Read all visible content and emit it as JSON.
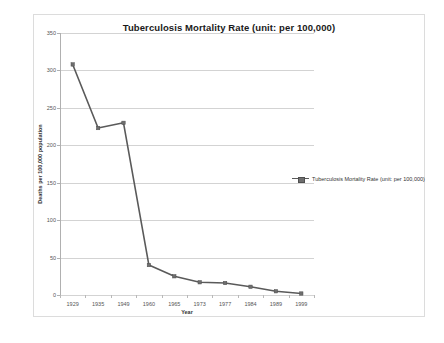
{
  "chart_data": {
    "type": "line",
    "title": "Tuberculosis Mortality Rate (unit: per 100,000)",
    "xlabel": "Year",
    "ylabel": "Deaths per 100,000 population",
    "categories": [
      "1929",
      "1935",
      "1949",
      "1960",
      "1965",
      "1973",
      "1977",
      "1984",
      "1989",
      "1999"
    ],
    "values": [
      308,
      223,
      230,
      40,
      25,
      17,
      16,
      11,
      5,
      2
    ],
    "series": [
      {
        "name": "Tuberculosis Mortality Rate (unit: per 100,000)",
        "values": [
          308,
          223,
          230,
          40,
          25,
          17,
          16,
          11,
          5,
          2
        ]
      }
    ],
    "ylim": [
      0,
      350
    ],
    "y_ticks": [
      0,
      50,
      100,
      150,
      200,
      250,
      300,
      350
    ],
    "y_tick_labels": [
      "0",
      "50",
      "100",
      "150",
      "200",
      "250",
      "300",
      "350"
    ],
    "grid": true,
    "legend_position": "right",
    "line_color": "#5a5a5a",
    "marker_color": "#6e6e6e",
    "gridline_color": "#d3d3d3",
    "plot_background": "#ffffff"
  },
  "legend": {
    "entries": [
      {
        "label": "Tuberculosis Mortality Rate (unit: per 100,000)"
      }
    ]
  }
}
